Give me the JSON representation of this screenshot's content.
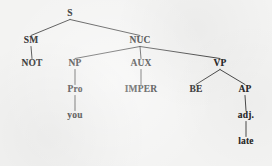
{
  "diagram": {
    "type": "constituency-tree",
    "sentence": "NOT you IMPER BE late",
    "ink_color": "#2b2b2b",
    "background_color": "#f3f3f2",
    "nodes": [
      {
        "id": "S",
        "label": "S",
        "x": 70,
        "y": 14,
        "kind": "category"
      },
      {
        "id": "SM",
        "label": "SM",
        "x": 31,
        "y": 41,
        "kind": "category"
      },
      {
        "id": "NUC",
        "label": "NUC",
        "x": 140,
        "y": 41,
        "kind": "category"
      },
      {
        "id": "NOT",
        "label": "NOT",
        "x": 32,
        "y": 64,
        "kind": "terminal"
      },
      {
        "id": "NP",
        "label": "NP",
        "x": 75,
        "y": 64,
        "kind": "category"
      },
      {
        "id": "AUX",
        "label": "AUX",
        "x": 141,
        "y": 64,
        "kind": "category"
      },
      {
        "id": "VP",
        "label": "VP",
        "x": 220,
        "y": 64,
        "kind": "category"
      },
      {
        "id": "Pro",
        "label": "Pro",
        "x": 75,
        "y": 90,
        "kind": "category"
      },
      {
        "id": "IMPER",
        "label": "IMPER",
        "x": 141,
        "y": 90,
        "kind": "terminal"
      },
      {
        "id": "BE",
        "label": "BE",
        "x": 196,
        "y": 90,
        "kind": "terminal"
      },
      {
        "id": "AP",
        "label": "AP",
        "x": 245,
        "y": 90,
        "kind": "category"
      },
      {
        "id": "you",
        "label": "you",
        "x": 75,
        "y": 116,
        "kind": "terminal"
      },
      {
        "id": "adj",
        "label": "adj.",
        "x": 246,
        "y": 116,
        "kind": "category"
      },
      {
        "id": "late",
        "label": "late",
        "x": 246,
        "y": 142,
        "kind": "terminal"
      }
    ],
    "edges": [
      {
        "from": "S",
        "to": "SM"
      },
      {
        "from": "S",
        "to": "NUC"
      },
      {
        "from": "SM",
        "to": "NOT"
      },
      {
        "from": "NUC",
        "to": "NP"
      },
      {
        "from": "NUC",
        "to": "AUX"
      },
      {
        "from": "NUC",
        "to": "VP"
      },
      {
        "from": "NP",
        "to": "Pro"
      },
      {
        "from": "AUX",
        "to": "IMPER"
      },
      {
        "from": "VP",
        "to": "BE"
      },
      {
        "from": "VP",
        "to": "AP"
      },
      {
        "from": "Pro",
        "to": "you"
      },
      {
        "from": "AP",
        "to": "adj"
      },
      {
        "from": "adj",
        "to": "late"
      }
    ]
  }
}
